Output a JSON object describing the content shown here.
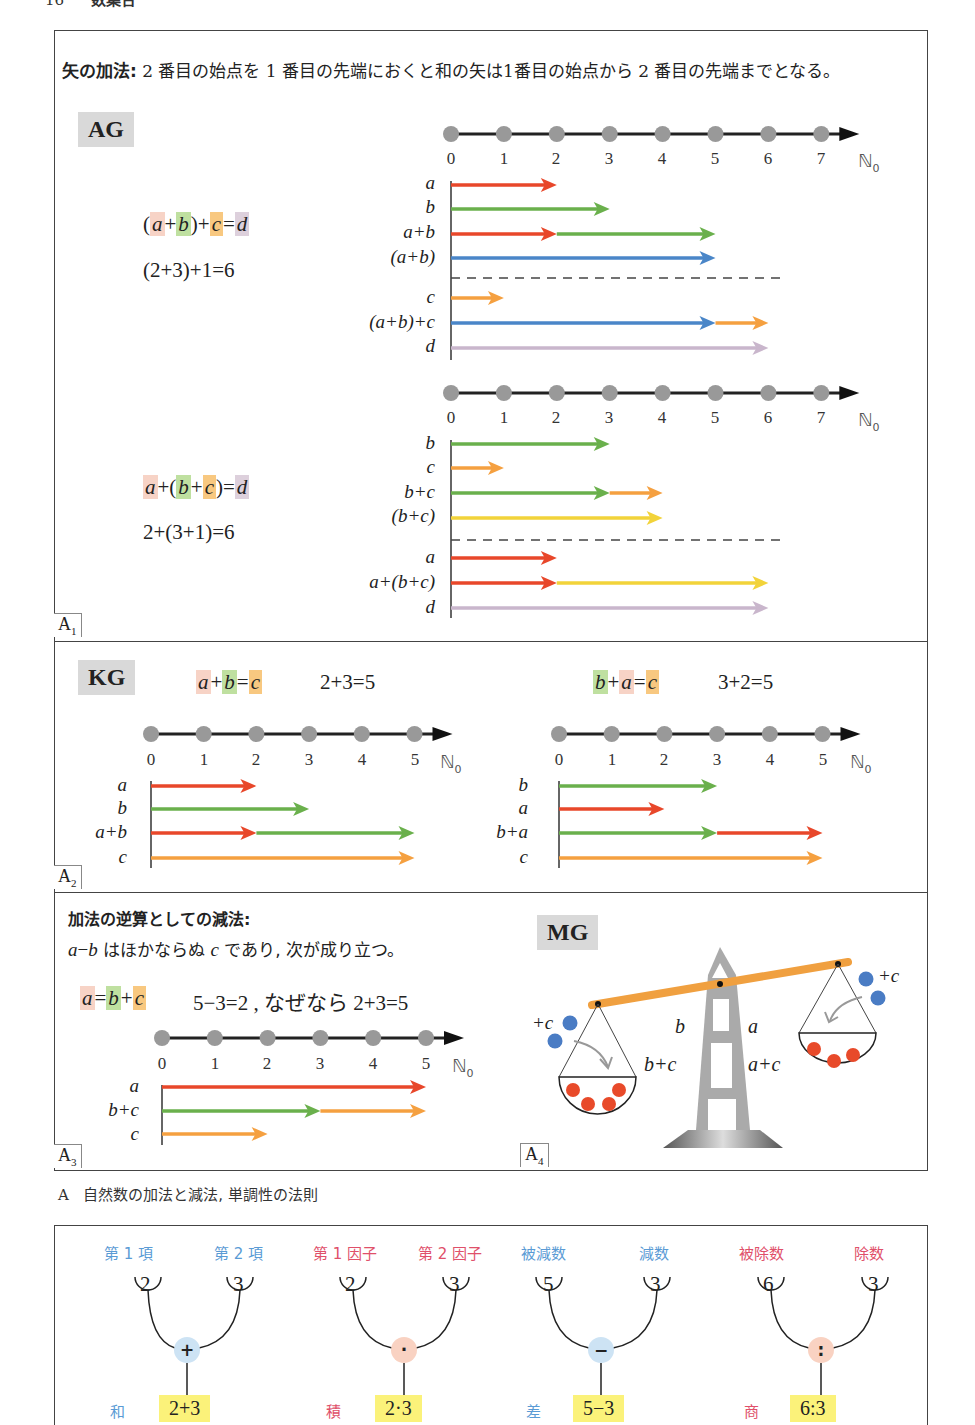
{
  "page_header": {
    "number": "16",
    "title": "数集合"
  },
  "intro": {
    "lead": "矢の加法:",
    "text": " 2 番目の始点を 1 番目の先端におくと和の矢は1番目の始点から 2 番目の先端までとなる。"
  },
  "colors": {
    "a": "#e8472a",
    "b": "#6ab04c",
    "c": "#f5a040",
    "d": "#c9b6cc",
    "sum_ab": "#4a86c8",
    "sum_bc": "#f2d33a",
    "axis_dot": "#999999",
    "beam": "#f0a040",
    "tower": "#aaaaaa",
    "weight_blue": "#4a7cc4",
    "weight_red": "#e84a2a"
  },
  "panel_A1": {
    "tag": "AG",
    "sublabel": "A",
    "sublabel_sub": "1",
    "part1": {
      "formula": [
        "(",
        "a",
        "+",
        "b",
        ")",
        "+",
        "c",
        "=",
        "d"
      ],
      "numeric": "(2+3)+1=6",
      "axis_ticks": [
        "0",
        "1",
        "2",
        "3",
        "4",
        "5",
        "6",
        "7"
      ],
      "axis_set": "ℕ",
      "axis_set_sub": "0",
      "rows": [
        {
          "label": "a",
          "segments": [
            {
              "from": 0,
              "to": 2,
              "color": "a"
            }
          ]
        },
        {
          "label": "b",
          "segments": [
            {
              "from": 0,
              "to": 3,
              "color": "b"
            }
          ]
        },
        {
          "label": "a+b",
          "segments": [
            {
              "from": 0,
              "to": 2,
              "color": "a"
            },
            {
              "from": 2,
              "to": 5,
              "color": "b"
            }
          ]
        },
        {
          "label": "(a+b)",
          "segments": [
            {
              "from": 0,
              "to": 5,
              "color": "sum_ab"
            }
          ]
        },
        {
          "label": "c",
          "segments": [
            {
              "from": 0,
              "to": 1,
              "color": "c"
            }
          ]
        },
        {
          "label": "(a+b)+c",
          "segments": [
            {
              "from": 0,
              "to": 5,
              "color": "sum_ab"
            },
            {
              "from": 5,
              "to": 6,
              "color": "c"
            }
          ]
        },
        {
          "label": "d",
          "segments": [
            {
              "from": 0,
              "to": 6,
              "color": "d"
            }
          ]
        }
      ]
    },
    "part2": {
      "formula": [
        "a",
        "+",
        "(",
        "b",
        "+",
        "c",
        ")",
        "=",
        "d"
      ],
      "numeric": "2+(3+1)=6",
      "axis_ticks": [
        "0",
        "1",
        "2",
        "3",
        "4",
        "5",
        "6",
        "7"
      ],
      "axis_set": "ℕ",
      "axis_set_sub": "0",
      "rows": [
        {
          "label": "b",
          "segments": [
            {
              "from": 0,
              "to": 3,
              "color": "b"
            }
          ]
        },
        {
          "label": "c",
          "segments": [
            {
              "from": 0,
              "to": 1,
              "color": "c"
            }
          ]
        },
        {
          "label": "b+c",
          "segments": [
            {
              "from": 0,
              "to": 3,
              "color": "b"
            },
            {
              "from": 3,
              "to": 4,
              "color": "c"
            }
          ]
        },
        {
          "label": "(b+c)",
          "segments": [
            {
              "from": 0,
              "to": 4,
              "color": "sum_bc"
            }
          ]
        },
        {
          "label": "a",
          "segments": [
            {
              "from": 0,
              "to": 2,
              "color": "a"
            }
          ]
        },
        {
          "label": "a+(b+c)",
          "segments": [
            {
              "from": 0,
              "to": 2,
              "color": "a"
            },
            {
              "from": 2,
              "to": 6,
              "color": "sum_bc"
            }
          ]
        },
        {
          "label": "d",
          "segments": [
            {
              "from": 0,
              "to": 6,
              "color": "d"
            }
          ]
        }
      ]
    }
  },
  "panel_A2": {
    "tag": "KG",
    "sublabel": "A",
    "sublabel_sub": "2",
    "left": {
      "formula": "a+b=c",
      "numeric": "2+3=5",
      "axis_ticks": [
        "0",
        "1",
        "2",
        "3",
        "4",
        "5"
      ],
      "axis_set": "ℕ",
      "axis_set_sub": "0",
      "rows": [
        {
          "label": "a",
          "segments": [
            {
              "from": 0,
              "to": 2,
              "color": "a"
            }
          ]
        },
        {
          "label": "b",
          "segments": [
            {
              "from": 0,
              "to": 3,
              "color": "b"
            }
          ]
        },
        {
          "label": "a+b",
          "segments": [
            {
              "from": 0,
              "to": 2,
              "color": "a"
            },
            {
              "from": 2,
              "to": 5,
              "color": "b"
            }
          ]
        },
        {
          "label": "c",
          "segments": [
            {
              "from": 0,
              "to": 5,
              "color": "c"
            }
          ]
        }
      ]
    },
    "right": {
      "formula": "b+a=c",
      "numeric": "3+2=5",
      "axis_ticks": [
        "0",
        "1",
        "2",
        "3",
        "4",
        "5"
      ],
      "axis_set": "ℕ",
      "axis_set_sub": "0",
      "rows": [
        {
          "label": "b",
          "segments": [
            {
              "from": 0,
              "to": 3,
              "color": "b"
            }
          ]
        },
        {
          "label": "a",
          "segments": [
            {
              "from": 0,
              "to": 2,
              "color": "a"
            }
          ]
        },
        {
          "label": "b+a",
          "segments": [
            {
              "from": 0,
              "to": 3,
              "color": "b"
            },
            {
              "from": 3,
              "to": 5,
              "color": "a"
            }
          ]
        },
        {
          "label": "c",
          "segments": [
            {
              "from": 0,
              "to": 5,
              "color": "c"
            }
          ]
        }
      ]
    }
  },
  "panel_A3": {
    "sublabel": "A",
    "sublabel_sub": "3",
    "heading": "加法の逆算としての減法:",
    "line2_var1": "a",
    "line2_op": "−",
    "line2_var2": "b",
    "line2_text1": " はほかならぬ ",
    "line2_var3": "c",
    "line2_text2": " であり, 次が成り立つ。",
    "formula": "a=b+c",
    "numeric": "5−3=2 , なぜなら 2+3=5",
    "axis_ticks": [
      "0",
      "1",
      "2",
      "3",
      "4",
      "5"
    ],
    "axis_set": "ℕ",
    "axis_set_sub": "0",
    "rows": [
      {
        "label": "a",
        "segments": [
          {
            "from": 0,
            "to": 5,
            "color": "a"
          }
        ]
      },
      {
        "label": "b+c",
        "segments": [
          {
            "from": 0,
            "to": 3,
            "color": "b"
          },
          {
            "from": 3,
            "to": 5,
            "color": "c"
          }
        ]
      },
      {
        "label": "c",
        "segments": [
          {
            "from": 0,
            "to": 2,
            "color": "c"
          }
        ]
      }
    ]
  },
  "panel_A4": {
    "tag": "MG",
    "sublabel": "A",
    "sublabel_sub": "4",
    "left_pan_label": "b",
    "right_pan_label": "a",
    "left_add": "+c",
    "right_add": "+c",
    "ineq1": {
      "left": "b",
      "op": ">",
      "right": "a"
    },
    "ineq2": {
      "left": "b+c",
      "op": ">",
      "right": "a+c"
    }
  },
  "caption": {
    "letter": "A",
    "text": "自然数の加法と減法, 単調性の法則"
  },
  "operations": [
    {
      "left_name": "第 1 項",
      "right_name": "第 2 項",
      "left_val": "2",
      "right_val": "3",
      "op": "+",
      "result_name": "和",
      "result": "2+3",
      "tone": "blue"
    },
    {
      "left_name": "第 1 因子",
      "right_name": "第 2 因子",
      "left_val": "2",
      "right_val": "3",
      "op": "·",
      "result_name": "積",
      "result": "2·3",
      "tone": "red"
    },
    {
      "left_name": "被減数",
      "right_name": "減数",
      "left_val": "5",
      "right_val": "3",
      "op": "−",
      "result_name": "差",
      "result": "5−3",
      "tone": "blue"
    },
    {
      "left_name": "被除数",
      "right_name": "除数",
      "left_val": "6",
      "right_val": "3",
      "op": ":",
      "result_name": "商",
      "result": "6:3",
      "tone": "red"
    }
  ]
}
